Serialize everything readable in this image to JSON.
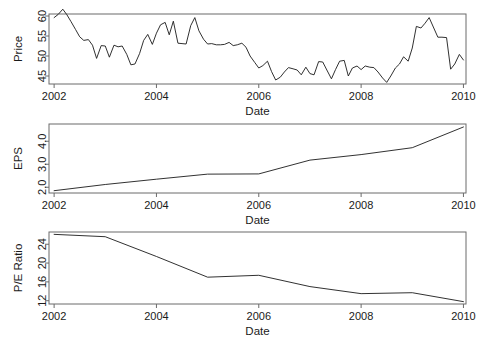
{
  "figure": {
    "type": "multi-panel-time-series",
    "panel_count": 3,
    "background": "#ffffff",
    "line_color": "#1a1a1a",
    "axis_color": "#6b6b6b"
  },
  "chart_data": [
    {
      "type": "line",
      "title": "",
      "xlabel": "Date",
      "ylabel": "Price",
      "xlim": [
        2001.9,
        2010.05
      ],
      "ylim": [
        43.0,
        60.5
      ],
      "xticks": [
        "2002",
        "2004",
        "2006",
        "2008",
        "2010"
      ],
      "xtick_values": [
        2002,
        2004,
        2006,
        2008,
        2010
      ],
      "yticks": [
        "45",
        "50",
        "55",
        "60"
      ],
      "ytick_values": [
        45,
        50,
        55,
        60
      ],
      "grid": false,
      "legend": "none",
      "series": [
        {
          "name": "Price",
          "x": [
            2002.0,
            2002.08,
            2002.17,
            2002.25,
            2002.33,
            2002.42,
            2002.5,
            2002.58,
            2002.67,
            2002.75,
            2002.83,
            2002.92,
            2003.0,
            2003.08,
            2003.17,
            2003.25,
            2003.33,
            2003.42,
            2003.5,
            2003.58,
            2003.67,
            2003.75,
            2003.83,
            2003.92,
            2004.0,
            2004.08,
            2004.17,
            2004.25,
            2004.33,
            2004.42,
            2004.5,
            2004.58,
            2004.67,
            2004.75,
            2004.83,
            2004.92,
            2005.0,
            2005.08,
            2005.17,
            2005.25,
            2005.33,
            2005.42,
            2005.5,
            2005.58,
            2005.67,
            2005.75,
            2005.83,
            2005.92,
            2006.0,
            2006.08,
            2006.17,
            2006.25,
            2006.33,
            2006.42,
            2006.5,
            2006.58,
            2006.67,
            2006.75,
            2006.83,
            2006.92,
            2007.0,
            2007.08,
            2007.17,
            2007.25,
            2007.33,
            2007.42,
            2007.5,
            2007.58,
            2007.67,
            2007.75,
            2007.83,
            2007.92,
            2008.0,
            2008.08,
            2008.17,
            2008.25,
            2008.33,
            2008.42,
            2008.5,
            2008.58,
            2008.67,
            2008.75,
            2008.83,
            2008.92,
            2009.0,
            2009.08,
            2009.17,
            2009.25,
            2009.33,
            2009.42,
            2009.5,
            2009.58,
            2009.67,
            2009.75,
            2009.83,
            2009.92,
            2010.0
          ],
          "y": [
            59.6,
            60.4,
            61.7,
            60.3,
            58.6,
            56.6,
            54.8,
            53.9,
            54.1,
            52.7,
            49.4,
            52.6,
            52.5,
            49.7,
            52.7,
            52.3,
            52.5,
            50.4,
            47.8,
            48.0,
            50.6,
            53.9,
            55.4,
            52.9,
            55.7,
            57.8,
            58.4,
            55.3,
            58.7,
            53.2,
            53.1,
            53.0,
            57.6,
            59.6,
            56.3,
            54.2,
            53.0,
            53.1,
            52.8,
            52.8,
            52.9,
            53.4,
            52.6,
            52.8,
            53.2,
            52.2,
            50.0,
            48.4,
            47.0,
            47.6,
            48.7,
            46.1,
            44.0,
            44.7,
            46.0,
            47.1,
            46.8,
            46.5,
            45.3,
            47.2,
            45.6,
            45.3,
            48.6,
            48.5,
            46.5,
            44.3,
            46.6,
            48.7,
            48.9,
            45.0,
            47.0,
            47.5,
            46.6,
            47.5,
            47.2,
            47.1,
            46.0,
            44.5,
            43.4,
            45.0,
            47.0,
            48.0,
            49.8,
            48.7,
            52.0,
            57.4,
            57.0,
            58.2,
            59.6,
            57.0,
            54.7,
            54.7,
            54.6,
            46.7,
            48.0,
            50.4,
            49.0
          ]
        }
      ]
    },
    {
      "type": "line",
      "title": "",
      "xlabel": "Date",
      "ylabel": "EPS",
      "xlim": [
        2001.9,
        2010.05
      ],
      "ylim": [
        1.75,
        4.75
      ],
      "xticks": [
        "2002",
        "2004",
        "2006",
        "2008",
        "2010"
      ],
      "xtick_values": [
        2002,
        2004,
        2006,
        2008,
        2010
      ],
      "yticks": [
        "2.0",
        "3.0",
        "4.0"
      ],
      "ytick_values": [
        2.0,
        3.0,
        4.0
      ],
      "grid": false,
      "legend": "none",
      "series": [
        {
          "name": "EPS",
          "x": [
            2002,
            2003,
            2004,
            2005,
            2006,
            2007,
            2008,
            2009,
            2010
          ],
          "y": [
            1.85,
            2.12,
            2.35,
            2.57,
            2.58,
            3.18,
            3.42,
            3.72,
            4.62
          ]
        }
      ]
    },
    {
      "type": "line",
      "title": "",
      "xlabel": "Date",
      "ylabel": "P/E Ratio",
      "xlim": [
        2001.9,
        2010.05
      ],
      "ylim": [
        11.3,
        26.6
      ],
      "xticks": [
        "2002",
        "2004",
        "2006",
        "2008",
        "2010"
      ],
      "xtick_values": [
        2002,
        2004,
        2006,
        2008,
        2010
      ],
      "yticks": [
        "12",
        "16",
        "20",
        "24"
      ],
      "ytick_values": [
        12,
        16,
        20,
        24
      ],
      "grid": false,
      "legend": "none",
      "series": [
        {
          "name": "P/E Ratio",
          "x": [
            2002,
            2003,
            2004,
            2005,
            2006,
            2007,
            2008,
            2009,
            2010
          ],
          "y": [
            26.1,
            25.6,
            21.4,
            17.0,
            17.4,
            15.0,
            13.5,
            13.7,
            11.8
          ]
        }
      ]
    }
  ]
}
